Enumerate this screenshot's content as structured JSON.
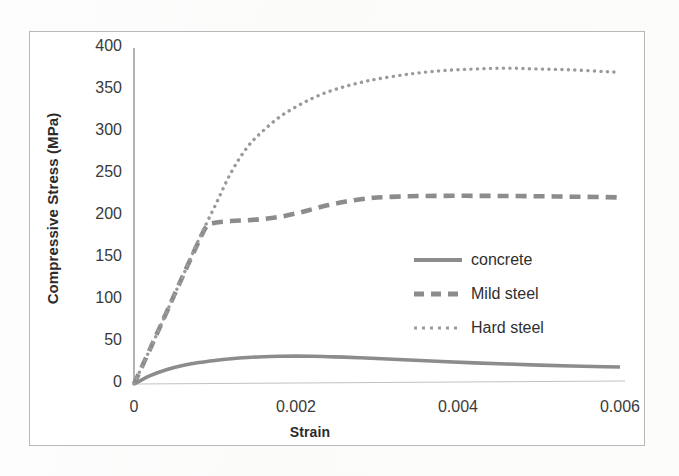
{
  "figure": {
    "kind": "scanned-figure",
    "frame_color": "#b9b9b9",
    "ink_color": "#8c8c8c"
  },
  "chart_data": {
    "type": "line",
    "title": "",
    "subtitle": "",
    "xlabel": "Strain",
    "ylabel": "Compressive Stress (MPa)",
    "xlim": [
      0,
      0.006
    ],
    "ylim": [
      0,
      400
    ],
    "xticks": [
      0,
      0.002,
      0.004,
      0.006
    ],
    "xtick_labels": [
      "0",
      "0.002",
      "0.004",
      "0.006"
    ],
    "yticks": [
      0,
      50,
      100,
      150,
      200,
      250,
      300,
      350,
      400
    ],
    "ytick_labels": [
      "0",
      "50",
      "100",
      "150",
      "200",
      "250",
      "300",
      "350",
      "400"
    ],
    "grid": false,
    "legend_position": "center-right",
    "series": [
      {
        "name": "concrete",
        "style": "solid",
        "color": "#8c8c8c",
        "x": [
          0,
          0.0002,
          0.0004,
          0.0006,
          0.0008,
          0.001,
          0.0012,
          0.0014,
          0.0016,
          0.0018,
          0.002,
          0.0022,
          0.0024,
          0.0026,
          0.0028,
          0.003,
          0.0034,
          0.0038,
          0.0042,
          0.0046,
          0.005,
          0.0054,
          0.0058,
          0.006
        ],
        "y": [
          0,
          10,
          17,
          22,
          25.5,
          28,
          30,
          31.5,
          32.5,
          33,
          33.2,
          33,
          32.5,
          32,
          31.2,
          30.3,
          28.5,
          26.8,
          25.2,
          23.8,
          22.5,
          21.4,
          20.5,
          20.2
        ]
      },
      {
        "name": "Mild steel",
        "style": "dashed",
        "color": "#8c8c8c",
        "x": [
          0,
          0.0002,
          0.0004,
          0.0006,
          0.0008,
          0.0009,
          0.001,
          0.0012,
          0.0014,
          0.0016,
          0.0018,
          0.002,
          0.0022,
          0.0024,
          0.0026,
          0.0028,
          0.003,
          0.0034,
          0.0038,
          0.0042,
          0.0046,
          0.005,
          0.0054,
          0.0058,
          0.006
        ],
        "y": [
          0,
          42,
          85,
          128,
          170,
          188,
          192,
          194,
          195,
          196.5,
          199,
          203,
          208,
          213,
          217,
          220,
          222,
          223.5,
          224,
          224,
          223.8,
          223.5,
          223,
          222.5,
          222
        ]
      },
      {
        "name": "Hard steel",
        "style": "dotted",
        "color": "#9a9a9a",
        "x": [
          0,
          0.0002,
          0.0004,
          0.0006,
          0.0008,
          0.001,
          0.0012,
          0.0014,
          0.0016,
          0.0018,
          0.002,
          0.0022,
          0.0024,
          0.0026,
          0.0028,
          0.003,
          0.0034,
          0.0038,
          0.0042,
          0.0046,
          0.005,
          0.0054,
          0.0058,
          0.006
        ],
        "y": [
          0,
          42,
          85,
          128,
          172,
          212,
          252,
          282,
          302,
          318,
          330,
          340,
          348,
          354,
          359,
          363,
          369,
          373,
          375,
          376,
          375,
          374,
          372,
          371
        ]
      }
    ]
  },
  "legend": {
    "items": [
      {
        "label": "concrete",
        "style": "solid"
      },
      {
        "label": "Mild steel",
        "style": "dashed"
      },
      {
        "label": "Hard steel",
        "style": "dotted"
      }
    ]
  }
}
